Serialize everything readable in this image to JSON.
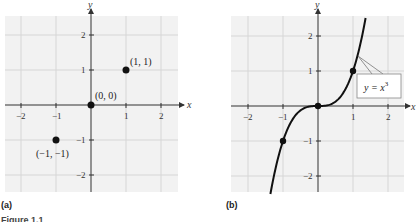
{
  "figure": {
    "caption": "Figure 1.1",
    "panels": [
      {
        "label": "(a)",
        "x_axis": "x",
        "y_axis": "y",
        "x_ticks": [
          "−2",
          "−1",
          "1",
          "2"
        ],
        "y_ticks": [
          "2",
          "1",
          "−1",
          "−2"
        ],
        "points": [
          {
            "label": "(1, 1)"
          },
          {
            "label": "(0, 0)"
          },
          {
            "label": "(−1, −1)"
          }
        ]
      },
      {
        "label": "(b)",
        "x_axis": "x",
        "y_axis": "y",
        "x_ticks": [
          "−2",
          "−1",
          "1",
          "2"
        ],
        "y_ticks": [
          "2",
          "1",
          "−1",
          "−2"
        ],
        "curve_label": "y = x",
        "curve_exponent": "3"
      }
    ]
  },
  "chart_data": [
    {
      "type": "scatter",
      "title": "(a)",
      "xlabel": "x",
      "ylabel": "y",
      "xlim": [
        -2.5,
        2.5
      ],
      "ylim": [
        -2.5,
        2.5
      ],
      "grid": true,
      "x": [
        1,
        0,
        -1
      ],
      "y": [
        1,
        0,
        -1
      ],
      "annotations": [
        "(1, 1)",
        "(0, 0)",
        "(−1, −1)"
      ]
    },
    {
      "type": "line",
      "title": "(b)",
      "xlabel": "x",
      "ylabel": "y",
      "xlim": [
        -2.5,
        2.5
      ],
      "ylim": [
        -2.5,
        2.5
      ],
      "grid": true,
      "series": [
        {
          "name": "y = x^3",
          "function": "x^3",
          "x_range": [
            -1.36,
            1.36
          ]
        }
      ],
      "highlighted_points": {
        "x": [
          -1,
          0,
          1
        ],
        "y": [
          -1,
          0,
          1
        ]
      }
    }
  ]
}
